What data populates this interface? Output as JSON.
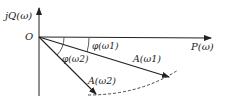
{
  "diagram": {
    "type": "phasor-plot",
    "axes": {
      "vertical_label": "jQ(ω)",
      "horizontal_label": "P(ω)",
      "origin_label": "O"
    },
    "vectors": [
      {
        "name": "A(ω1)",
        "label": "A(ω1)",
        "angle_label": "φ(ω1)"
      },
      {
        "name": "A(ω2)",
        "label": "A(ω2)",
        "angle_label": "φ(ω2)"
      }
    ],
    "locus": "dashed arc through vector tips",
    "colors": {
      "line": "#222222",
      "background": "#ffffff"
    }
  }
}
